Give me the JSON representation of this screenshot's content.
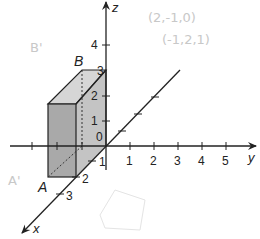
{
  "diagram": {
    "type": "3d-coordinate-axes-with-box",
    "axes": {
      "x": {
        "label": "x",
        "ticks": [
          "1",
          "2",
          "3"
        ]
      },
      "y": {
        "label": "y",
        "ticks": [
          "1",
          "2",
          "3",
          "4",
          "5"
        ]
      },
      "z": {
        "label": "z",
        "ticks": [
          "1",
          "2",
          "3",
          "4"
        ]
      },
      "origin_label": "0"
    },
    "box": {
      "dimensions": {
        "x": 2,
        "y": -1,
        "z": 3
      },
      "points": [
        {
          "label": "A"
        },
        {
          "label": "B"
        }
      ],
      "front_color": "#a9a9a9",
      "side_color": "#c4c4c4",
      "top_color": "#d6d6d6"
    },
    "handwritten_notes": [
      "(2,-1,0)",
      "(-1,2,1)",
      "B'",
      "A'"
    ]
  }
}
